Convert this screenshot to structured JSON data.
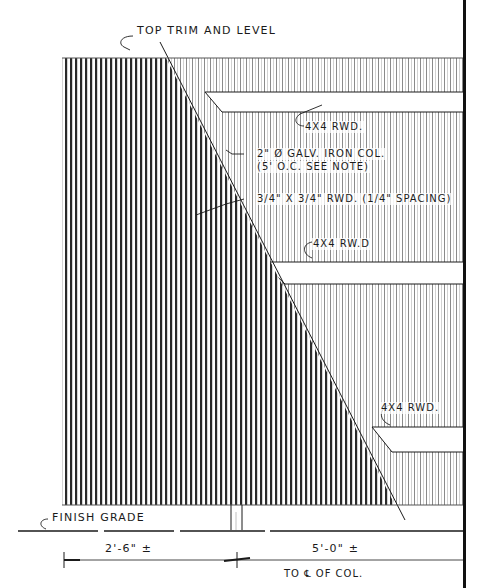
{
  "drawing": {
    "type": "architectural elevation sketch",
    "subject": "wood screen fence with angled section cut",
    "colors": {
      "ink": "#1a1a1a",
      "paper": "#ffffff",
      "hatch_dense": "#2a2a2a",
      "hatch_light": "#8a8a8a"
    }
  },
  "annotations": {
    "top": "TOP TRIM AND LEVEL",
    "rail_top": "4X4 RWD.",
    "column_line1": "2\" Ø GALV. IRON COL.",
    "column_line2": "(5' O.C. SEE NOTE)",
    "slats": "3/4\" X 3/4\" RWD. (1/4\" SPACING)",
    "rail_middle": "4X4 RW.D",
    "rail_bottom": "4X4 RWD.",
    "grade": "FINISH GRADE"
  },
  "dimensions": {
    "left": "2'-6\" ±",
    "right": "5'-0\" ±",
    "right_note": "TO ℄ OF COL."
  }
}
